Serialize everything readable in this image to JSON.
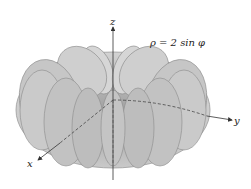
{
  "figure": {
    "equation": "ρ = 2 sin φ",
    "axes": {
      "x_label": "x",
      "y_label": "y",
      "z_label": "z"
    },
    "surface": "torus-like solid (spherical coordinates)"
  },
  "colors": {
    "surface_fill": "#c8c8c8",
    "surface_edge": "#8a8a8a",
    "axis": "#333333",
    "background": "#ffffff"
  }
}
